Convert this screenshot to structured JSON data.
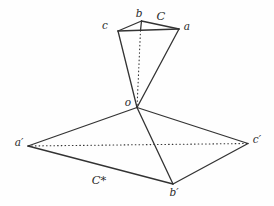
{
  "figure": {
    "background_color": "#fefefe",
    "stroke_color": "#333333",
    "label_color": "#2b2b2b",
    "vertices": {
      "b": {
        "x": 141.5,
        "y": 21
      },
      "c": {
        "x": 118,
        "y": 31
      },
      "a": {
        "x": 179,
        "y": 29
      },
      "foot": {
        "x": 140.5,
        "y": 30.5
      },
      "o": {
        "x": 137,
        "y": 107.5
      },
      "a_prime": {
        "x": 28,
        "y": 146
      },
      "b_prime": {
        "x": 173,
        "y": 184
      },
      "c_prime": {
        "x": 248,
        "y": 143.5
      }
    },
    "edges": [
      {
        "name": "edge-c-b",
        "from": "c",
        "to": "b",
        "style": "solid"
      },
      {
        "name": "edge-b-a",
        "from": "b",
        "to": "a",
        "style": "solid"
      },
      {
        "name": "edge-c-a",
        "from": "c",
        "to": "a",
        "style": "solid"
      },
      {
        "name": "edge-b-altitude",
        "from": "b",
        "to": "foot",
        "style": "solid"
      },
      {
        "name": "edge-foot-o-hidden",
        "from": "foot",
        "to": "o",
        "style": "dotted"
      },
      {
        "name": "edge-c-o",
        "from": "c",
        "to": "o",
        "style": "solid"
      },
      {
        "name": "edge-a-o",
        "from": "a",
        "to": "o",
        "style": "solid"
      },
      {
        "name": "edge-o-aprime",
        "from": "o",
        "to": "a_prime",
        "style": "solid"
      },
      {
        "name": "edge-o-cprime",
        "from": "o",
        "to": "c_prime",
        "style": "solid"
      },
      {
        "name": "edge-o-bprime",
        "from": "o",
        "to": "b_prime",
        "style": "solid"
      },
      {
        "name": "edge-aprime-bprime",
        "from": "a_prime",
        "to": "b_prime",
        "style": "solid"
      },
      {
        "name": "edge-bprime-cprime",
        "from": "b_prime",
        "to": "c_prime",
        "style": "solid"
      },
      {
        "name": "edge-aprime-cprime-hidden",
        "from": "a_prime",
        "to": "c_prime",
        "style": "dotted"
      }
    ],
    "labels": [
      {
        "name": "label-b",
        "text": "b",
        "x": 139,
        "y": 17,
        "kind": "vertex"
      },
      {
        "name": "label-C",
        "text": "C",
        "x": 161,
        "y": 20,
        "kind": "set"
      },
      {
        "name": "label-c",
        "text": "c",
        "x": 105,
        "y": 29,
        "kind": "vertex"
      },
      {
        "name": "label-a",
        "text": "a",
        "x": 187,
        "y": 30,
        "kind": "vertex"
      },
      {
        "name": "label-o",
        "text": "o",
        "x": 128,
        "y": 106,
        "kind": "vertex"
      },
      {
        "name": "label-a-prime",
        "text": "a′",
        "x": 19,
        "y": 146,
        "kind": "vertex"
      },
      {
        "name": "label-c-prime",
        "text": "c′",
        "x": 257,
        "y": 143,
        "kind": "vertex"
      },
      {
        "name": "label-b-prime",
        "text": "b′",
        "x": 174,
        "y": 196,
        "kind": "vertex"
      },
      {
        "name": "label-C-star",
        "text": "C*",
        "x": 99,
        "y": 184,
        "kind": "set"
      }
    ]
  }
}
